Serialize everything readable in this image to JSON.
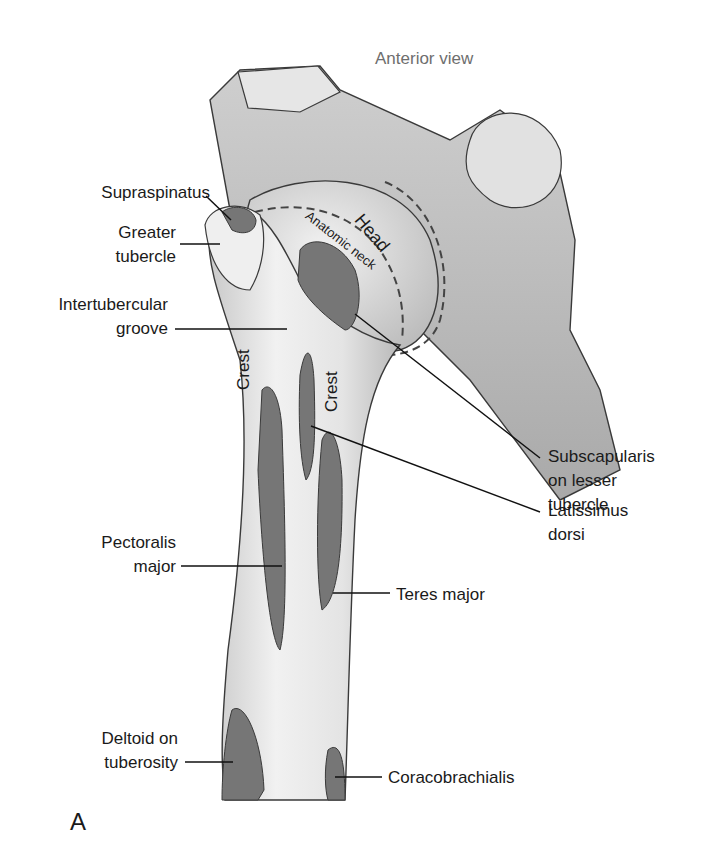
{
  "figure": {
    "panel_letter": "A",
    "view_title": "Anterior view",
    "colors": {
      "background": "#ffffff",
      "bone_light": "#e9e9e9",
      "bone_mid": "#c8c8c8",
      "bone_shadow": "#9a9a9a",
      "muscle_attachment": "#767676",
      "outline": "#3a3a3a",
      "leader_line": "#111111",
      "text": "#1a1a1a",
      "title_text": "#6e6e6e"
    }
  },
  "labels": {
    "supraspinatus": "Supraspinatus",
    "greater_tubercle_1": "Greater",
    "greater_tubercle_2": "tubercle",
    "intertubercular_1": "Intertubercular",
    "intertubercular_2": "groove",
    "pectoralis_1": "Pectoralis",
    "pectoralis_2": "major",
    "deltoid_1": "Deltoid on",
    "deltoid_2": "tuberosity",
    "subscapularis_1": "Subscapularis",
    "subscapularis_2": "on lesser",
    "subscapularis_3": "tubercle",
    "latissimus_1": "Latissimus",
    "latissimus_2": "dorsi",
    "teres_major": "Teres major",
    "coracobrachialis": "Coracobrachialis"
  },
  "structure_labels": {
    "head": "Head",
    "anatomic_neck": "Anatomic neck",
    "crest_left": "Crest",
    "crest_right": "Crest"
  }
}
